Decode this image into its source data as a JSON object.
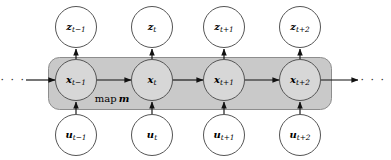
{
  "figure": {
    "type": "dynamic-bayesian-network-diagram",
    "background_color": "#ffffff",
    "plate_color": "#c9c9c9",
    "plate_border_color": "#8a8a8a",
    "node_fill": "#ffffff",
    "node_stroke": "#444444",
    "arrow_color": "#1a1a1a",
    "plate": {
      "label_word": "map",
      "label_symbol": "m",
      "x": 48,
      "y": 57,
      "width": 284,
      "height": 53,
      "radius": 11
    },
    "ellipsis": {
      "left": "· · ·",
      "right": "· · ·"
    },
    "geometry": {
      "node_radius": 21,
      "row_y_z": 27,
      "row_y_x": 80,
      "row_y_u": 135,
      "column_x": [
        76,
        152,
        224,
        300
      ]
    },
    "rows": [
      {
        "name": "measurement-row",
        "symbol": "z",
        "nodes": [
          {
            "id": "z-t-minus-1",
            "symbol": "z",
            "subscript": "t−1",
            "cx": 76,
            "cy": 27
          },
          {
            "id": "z-t",
            "symbol": "z",
            "subscript": "t",
            "cx": 152,
            "cy": 27
          },
          {
            "id": "z-t-plus-1",
            "symbol": "z",
            "subscript": "t+1",
            "cx": 224,
            "cy": 27
          },
          {
            "id": "z-t-plus-2",
            "symbol": "z",
            "subscript": "t+2",
            "cx": 300,
            "cy": 27
          }
        ]
      },
      {
        "name": "state-row",
        "symbol": "x",
        "nodes": [
          {
            "id": "x-t-minus-1",
            "symbol": "x",
            "subscript": "t−1",
            "cx": 76,
            "cy": 80
          },
          {
            "id": "x-t",
            "symbol": "x",
            "subscript": "t",
            "cx": 152,
            "cy": 80
          },
          {
            "id": "x-t-plus-1",
            "symbol": "x",
            "subscript": "t+1",
            "cx": 224,
            "cy": 80
          },
          {
            "id": "x-t-plus-2",
            "symbol": "x",
            "subscript": "t+2",
            "cx": 300,
            "cy": 80
          }
        ]
      },
      {
        "name": "control-row",
        "symbol": "u",
        "nodes": [
          {
            "id": "u-t-minus-1",
            "symbol": "u",
            "subscript": "t−1",
            "cx": 76,
            "cy": 135
          },
          {
            "id": "u-t",
            "symbol": "u",
            "subscript": "t",
            "cx": 152,
            "cy": 135
          },
          {
            "id": "u-t-plus-1",
            "symbol": "u",
            "subscript": "t+1",
            "cx": 224,
            "cy": 135
          },
          {
            "id": "u-t-plus-2",
            "symbol": "u",
            "subscript": "t+2",
            "cx": 300,
            "cy": 135
          }
        ]
      }
    ],
    "edges": [
      {
        "name": "edge-incoming-left",
        "from": "ellipsis-left",
        "to": "x-t-minus-1"
      },
      {
        "name": "edge-x1-x2",
        "from": "x-t-minus-1",
        "to": "x-t"
      },
      {
        "name": "edge-x2-x3",
        "from": "x-t",
        "to": "x-t-plus-1"
      },
      {
        "name": "edge-x3-x4",
        "from": "x-t-plus-1",
        "to": "x-t-plus-2"
      },
      {
        "name": "edge-outgoing-right",
        "from": "x-t-plus-2",
        "to": "ellipsis-right"
      },
      {
        "name": "edge-x1-z1",
        "from": "x-t-minus-1",
        "to": "z-t-minus-1"
      },
      {
        "name": "edge-x2-z2",
        "from": "x-t",
        "to": "z-t"
      },
      {
        "name": "edge-x3-z3",
        "from": "x-t-plus-1",
        "to": "z-t-plus-1"
      },
      {
        "name": "edge-x4-z4",
        "from": "x-t-plus-2",
        "to": "z-t-plus-2"
      },
      {
        "name": "edge-u1-x1",
        "from": "u-t-minus-1",
        "to": "x-t-minus-1"
      },
      {
        "name": "edge-u2-x2",
        "from": "u-t",
        "to": "x-t"
      },
      {
        "name": "edge-u3-x3",
        "from": "u-t-plus-1",
        "to": "x-t-plus-1"
      },
      {
        "name": "edge-u4-x4",
        "from": "u-t-plus-2",
        "to": "x-t-plus-2"
      }
    ]
  }
}
